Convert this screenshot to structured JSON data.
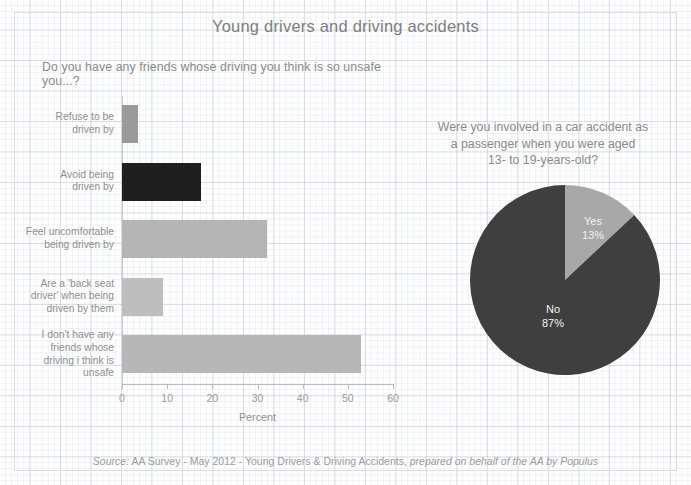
{
  "page": {
    "title": "Young drivers and driving accidents",
    "source_prefix": "Source:",
    "source_main": " AA Survey - May 2012 - Young Drivers & Driving Accidents, ",
    "source_italic": "prepared on behalf of the AA by Populus"
  },
  "bar_panel": {
    "question": "Do you have any friends whose driving you think is so unsafe you...?",
    "x_axis_title": "Percent"
  },
  "pie_panel": {
    "question_line1": "Were you involved in a car accident as",
    "question_line2": "a passenger when you were aged",
    "question_line3": "13- to 19-years-old?"
  },
  "colors": {
    "bar_1": "#9a9a9a",
    "bar_2": "#1f1f1f",
    "bar_3": "#b4b4b4",
    "bar_4": "#bebebe",
    "bar_5": "#b7b7b7",
    "pie_yes": "#a8a8a8",
    "pie_no": "#3f3f3f",
    "grid": "#dfe4ec",
    "text": "#8a8a8a"
  },
  "chart_data": [
    {
      "type": "bar",
      "orientation": "horizontal",
      "title": "Do you have any friends whose driving you think is so unsafe you...?",
      "xlabel": "Percent",
      "ylabel": "",
      "xlim": [
        0,
        60
      ],
      "xticks": [
        0,
        10,
        20,
        30,
        40,
        50,
        60
      ],
      "grid": false,
      "categories": [
        "Refuse to be driven by",
        "Avoid being driven by",
        "Feel uncomfortable being driven by",
        "Are a 'back seat driver' when being driven by them",
        "I don't have any friends whose driving i think is unsafe"
      ],
      "category_lines": [
        [
          "Refuse to be",
          "driven by"
        ],
        [
          "Avoid being",
          "driven by"
        ],
        [
          "Feel uncomfortable",
          "being driven by"
        ],
        [
          "Are a 'back seat",
          "driver' when being",
          "driven by them"
        ],
        [
          "I don't have any",
          "friends whose",
          "driving i think is",
          "unsafe"
        ]
      ],
      "values": [
        3.5,
        17.5,
        32,
        9,
        53
      ],
      "bar_colors": [
        "#9a9a9a",
        "#1f1f1f",
        "#b4b4b4",
        "#bebebe",
        "#b7b7b7"
      ]
    },
    {
      "type": "pie",
      "title": "Were you involved in a car accident as a passenger when you were aged 13- to 19-years-old?",
      "labels": [
        "Yes",
        "No"
      ],
      "values": [
        13,
        87
      ],
      "value_labels": [
        "13%",
        "87%"
      ],
      "slice_colors": [
        "#a8a8a8",
        "#3f3f3f"
      ],
      "start_angle_deg": 0,
      "direction": "clockwise",
      "legend": "none"
    }
  ]
}
